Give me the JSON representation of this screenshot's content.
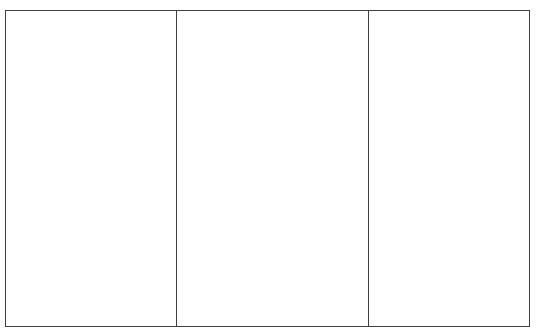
{
  "page": {
    "background_color": "#ffffff",
    "width": 539,
    "height": 336
  },
  "table": {
    "name": "empty-three-column-table",
    "border_color": "#3f4042",
    "border_width_px": 1.5,
    "background_color": "#ffffff",
    "column_count": 3,
    "row_count": 1,
    "headers": [
      "",
      "",
      ""
    ],
    "rows": [
      {
        "cells": [
          "",
          "",
          ""
        ]
      }
    ]
  }
}
